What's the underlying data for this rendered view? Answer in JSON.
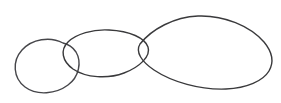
{
  "canvas": {
    "width": 281,
    "height": 103,
    "background_color": "#ffffff",
    "title": "Three overlapping hand-drawn ellipses"
  },
  "style": {
    "stroke_color": "#3a3a3c",
    "stroke_color_secondary": "#46464a",
    "stroke_width": 1.4,
    "fill": "none"
  },
  "diagram": {
    "type": "overlapping-closed-curves",
    "shape_count": 3,
    "shapes": [
      {
        "id": "ellipse-left-small",
        "label": "left small ellipse",
        "center_x": 49,
        "center_y": 66,
        "radius_x": 35,
        "radius_y": 28,
        "rotation_deg": -8,
        "bounds": {
          "x_min": 14,
          "y_min": 38,
          "x_max": 84,
          "y_max": 95
        },
        "path": "M 63 43 C 50 36 32 39 22 50 C 12 61 13 78 25 87 C 37 96 56 94 68 85 C 79 77 82 62 76 52 C 72 46 68 44 63 43 Z"
      },
      {
        "id": "ellipse-middle-tilted",
        "label": "middle tilted ellipse",
        "center_x": 106,
        "center_y": 54,
        "radius_x": 45,
        "radius_y": 24,
        "rotation_deg": -10,
        "bounds": {
          "x_min": 62,
          "y_min": 29,
          "x_max": 151,
          "y_max": 79
        },
        "path": "M 109 30 C 93 29 76 34 68 42 C 60 50 62 61 73 69 C 86 78 108 79 124 73 C 140 67 151 56 148 47 C 145 38 130 31 109 30 Z"
      },
      {
        "id": "ellipse-right-large",
        "label": "right large egg-shaped curve",
        "center_x": 203,
        "center_y": 52,
        "radius_x": 70,
        "radius_y": 37,
        "rotation_deg": 0,
        "bounds": {
          "x_min": 133,
          "y_min": 15,
          "x_max": 273,
          "y_max": 90
        },
        "path": "M 140 44 C 152 29 174 17 198 16 C 224 15 250 26 264 42 C 274 54 273 64 269 71 C 263 81 247 88 226 89 C 200 90 172 82 154 70 C 142 62 135 52 140 44 Z"
      }
    ],
    "intersections": [
      {
        "id": "overlap-left-middle",
        "between": [
          "ellipse-left-small",
          "ellipse-middle-tilted"
        ],
        "region": "lens",
        "center_x": 70,
        "center_y": 58
      },
      {
        "id": "overlap-middle-right",
        "between": [
          "ellipse-middle-tilted",
          "ellipse-right-large"
        ],
        "region": "narrow-lens",
        "center_x": 143,
        "center_y": 54
      }
    ]
  }
}
